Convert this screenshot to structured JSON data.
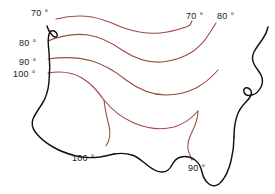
{
  "figure": {
    "name": "us-isotherm-contour-map",
    "background_color": "#ffffff",
    "width": 275,
    "height": 194
  },
  "style": {
    "contour_color": "#9c4a42",
    "coastline_color": "#111111",
    "label_color": "#1a1a1a"
  },
  "labels": [
    {
      "id": "label-70-topleft",
      "text": "70 °",
      "value": "70",
      "unit": "°",
      "x": 31,
      "y": 8
    },
    {
      "id": "label-80-left",
      "text": "80 °",
      "value": "80",
      "unit": "°",
      "x": 19,
      "y": 38
    },
    {
      "id": "label-90-left",
      "text": "90 °",
      "value": "90",
      "unit": "°",
      "x": 19,
      "y": 57
    },
    {
      "id": "label-100-left",
      "text": "100 °",
      "value": "100",
      "unit": "°",
      "x": 13,
      "y": 69
    },
    {
      "id": "label-70-topright",
      "text": "70 °",
      "value": "70",
      "unit": "°",
      "x": 186,
      "y": 11
    },
    {
      "id": "label-80-topright",
      "text": "80 °",
      "value": "80",
      "unit": "°",
      "x": 217,
      "y": 11
    },
    {
      "id": "label-100-bottom",
      "text": "100 °",
      "value": "100",
      "unit": "°",
      "x": 72,
      "y": 153
    },
    {
      "id": "label-90-bottom",
      "text": "90 °",
      "value": "90",
      "unit": "°",
      "x": 188,
      "y": 163
    }
  ],
  "contours": [
    {
      "id": "contour-70",
      "value": "70",
      "d": "M 56 19 C 68 16 80 15 92 17 C 104 19 114 24 124 28 C 136 32 148 34 160 33 C 172 32 180 29 186 27 L 190 25 L 192 21"
    },
    {
      "id": "contour-80",
      "value": "80",
      "d": "M 48 41 C 60 36 74 33 88 35 C 102 37 112 43 122 50 C 134 58 148 63 162 62 C 174 61 184 57 192 52 C 198 48 204 42 209 34 L 216 23"
    },
    {
      "id": "contour-90",
      "value": "90",
      "d": "M 48 59 C 62 57 78 57 92 61 C 106 65 116 72 126 80 C 138 89 152 95 166 95 C 178 95 188 92 196 88 C 205 83 212 77 218 70"
    },
    {
      "id": "contour-100",
      "value": "100",
      "d": "M 48 73 C 60 71 72 72 82 78 C 92 84 98 92 104 100 C 112 110 122 118 134 123 C 148 129 162 130 174 127 C 184 124 192 118 198 111"
    },
    {
      "id": "contour-90-descending",
      "value": "90",
      "d": "M 198 111 C 198 120 195 126 192 132 C 189 138 187 143 188 149 C 189 154 191 157 192 160"
    },
    {
      "id": "contour-100-descending",
      "value": "100",
      "d": "M 104 100 C 105 110 107 118 109 126 C 111 134 110 140 106 146"
    }
  ],
  "coastline": {
    "id": "us-coastline-outline",
    "segments": [
      {
        "id": "west-coast",
        "d": "M 47 26 C 48 30 50 33 52 35 C 54 37 56 38 57 36 C 58 34 56 32 54 31 C 52 30 50 31 49 34 C 48 38 48 44 49 52 C 50 62 50 72 49 82 C 48 92 46 98 42 104 C 38 110 35 114 33 119 C 31 124 32 128 36 133 C 40 138 46 143 53 147 C 60 151 68 154 76 156 C 84 158 92 158 100 157 C 106 156 110 155 114 154"
      },
      {
        "id": "gulf-coast",
        "d": "M 114 154 C 120 153 126 153 132 155 C 138 157 142 161 147 165 C 152 169 157 172 162 172 C 167 172 170 169 172 165 C 174 161 177 158 181 157 C 186 156 191 157 195 160 C 199 163 201 167 202 172 C 203 177 205 181 209 184 C 213 187 218 186 222 181 C 226 176 229 169 231 161 C 233 153 234 145 234 137"
      },
      {
        "id": "east-coast",
        "d": "M 234 137 C 234 129 235 122 237 116 C 239 110 242 106 245 103 C 248 100 250 98 251 95 C 252 92 251 89 248 88 C 245 87 243 89 244 92 C 245 95 248 96 252 95 C 256 94 259 91 261 87 C 263 83 263 79 261 75 C 259 71 256 68 254 64 C 252 60 252 56 254 52 C 256 48 259 44 262 40 C 265 36 267 32 268 27"
      }
    ]
  }
}
